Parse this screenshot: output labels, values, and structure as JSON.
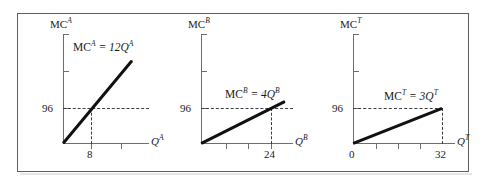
{
  "figure": {
    "background_color": "#ffffff",
    "frame_color": "#5d5f61",
    "curve_color": "#111111",
    "axis_color": "#6b6d6f",
    "dash_color": "#3a3c3e"
  },
  "panels": [
    {
      "id": "panel-a",
      "y_axis_label_base": "MC",
      "y_axis_label_sup": "A",
      "x_axis_label_base": "Q",
      "x_axis_label_sup": "A",
      "equation_base": "MC",
      "equation_sup": "A",
      "equation_rhs": " = 12Q",
      "equation_rhs_sup": "A",
      "equation_text": "MC^A = 12Q^A",
      "slope": 12,
      "price_label": "96",
      "price_value": 96,
      "quantity_label": "8",
      "quantity_value": 8,
      "origin_label": "",
      "x_ticks": [
        "8",
        ""
      ],
      "y_ticks": [
        "",
        "",
        "96"
      ]
    },
    {
      "id": "panel-b",
      "y_axis_label_base": "MC",
      "y_axis_label_sup": "B",
      "x_axis_label_base": "Q",
      "x_axis_label_sup": "B",
      "equation_base": "MC",
      "equation_sup": "B",
      "equation_rhs": " = 4Q",
      "equation_rhs_sup": "B",
      "equation_text": "MC^B = 4Q^B",
      "slope": 4,
      "price_label": "96",
      "price_value": 96,
      "quantity_label": "24",
      "quantity_value": 24,
      "origin_label": "",
      "x_ticks": [
        "",
        "",
        "24"
      ],
      "y_ticks": [
        "",
        "",
        "96"
      ]
    },
    {
      "id": "panel-t",
      "y_axis_label_base": "MC",
      "y_axis_label_sup": "T",
      "x_axis_label_base": "Q",
      "x_axis_label_sup": "T",
      "equation_base": "MC",
      "equation_sup": "T",
      "equation_rhs": " = 3Q",
      "equation_rhs_sup": "T",
      "equation_text": "MC^T = 3Q^T",
      "slope": 3,
      "price_label": "96",
      "price_value": 96,
      "quantity_label": "32",
      "quantity_value": 32,
      "origin_label": "0",
      "x_ticks": [
        "",
        "",
        "",
        "32"
      ],
      "y_ticks": [
        "",
        "",
        "96"
      ]
    }
  ],
  "chart_data": {
    "type": "line",
    "title": "",
    "xlabel": "Quantity",
    "ylabel": "Marginal Cost",
    "series": [
      {
        "name": "MC^A = 12Q^A",
        "slope": 12,
        "points": [
          [
            0,
            0
          ],
          [
            8,
            96
          ]
        ],
        "panel": "panel-a"
      },
      {
        "name": "MC^B = 4Q^B",
        "slope": 4,
        "points": [
          [
            0,
            0
          ],
          [
            24,
            96
          ]
        ],
        "panel": "panel-b"
      },
      {
        "name": "MC^T = 3Q^T",
        "slope": 3,
        "points": [
          [
            0,
            0
          ],
          [
            32,
            96
          ]
        ],
        "panel": "panel-t"
      }
    ],
    "reference_line_y": 96,
    "grid": false,
    "legend": "none"
  }
}
